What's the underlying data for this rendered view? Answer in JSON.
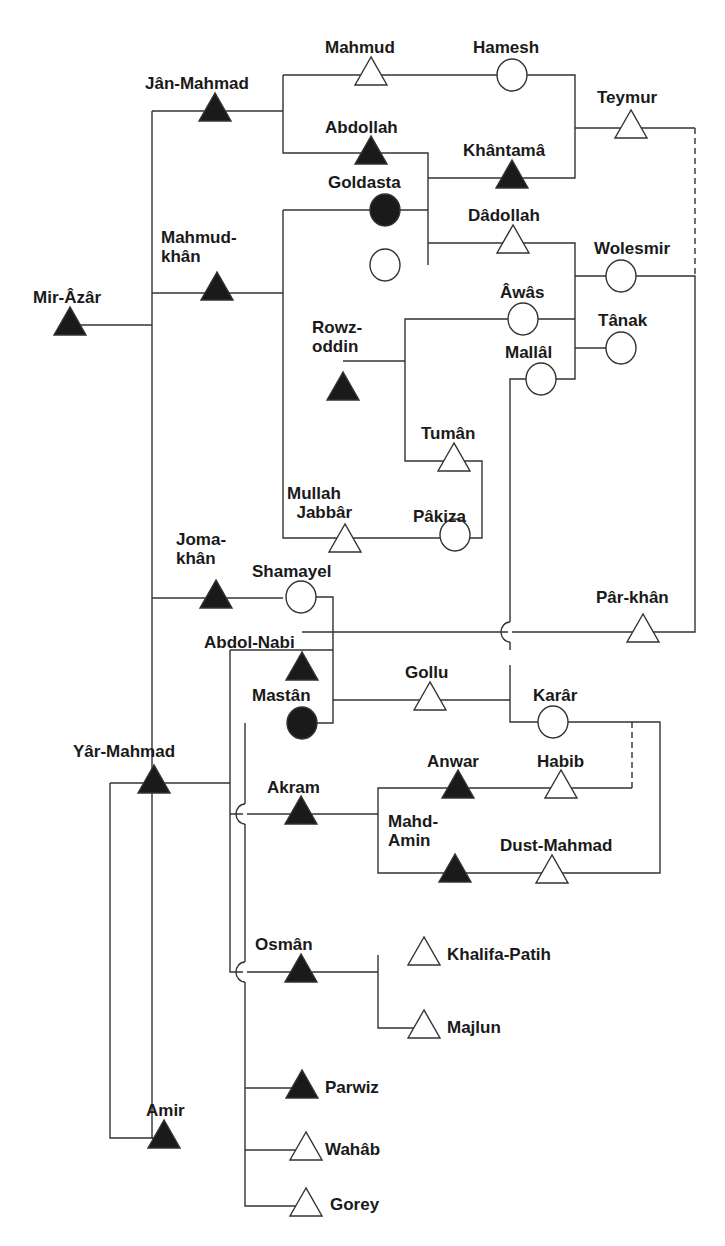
{
  "diagram": {
    "type": "kinship-genealogy",
    "legend_symbols": {
      "filled-triangle": "male (focal/linked)",
      "open-triangle": "male",
      "filled-circle": "female (focal/linked)",
      "open-circle": "female"
    },
    "colors": {
      "line": "#333333",
      "fill": "#1a1a1a",
      "background": "#ffffff"
    },
    "nodes": [
      {
        "id": "mir-azar",
        "label": "Mir-Âzâr",
        "shape": "triangle",
        "filled": true,
        "x": 70,
        "y": 325,
        "lx": 33,
        "ly": 288
      },
      {
        "id": "jan-mahmad",
        "label": "Jân-Mahmad",
        "shape": "triangle",
        "filled": true,
        "x": 215,
        "y": 111,
        "lx": 145,
        "ly": 74
      },
      {
        "id": "mahmud",
        "label": "Mahmud",
        "shape": "triangle",
        "filled": false,
        "x": 371,
        "y": 75,
        "lx": 325,
        "ly": 38
      },
      {
        "id": "hamesh",
        "label": "Hamesh",
        "shape": "circle",
        "filled": false,
        "x": 512,
        "y": 75,
        "lx": 473,
        "ly": 38
      },
      {
        "id": "teymur",
        "label": "Teymur",
        "shape": "triangle",
        "filled": false,
        "x": 631,
        "y": 128,
        "lx": 597,
        "ly": 88
      },
      {
        "id": "abdollah",
        "label": "Abdollah",
        "shape": "triangle",
        "filled": true,
        "x": 371,
        "y": 154,
        "lx": 325,
        "ly": 118
      },
      {
        "id": "khantama",
        "label": "Khântamâ",
        "shape": "triangle",
        "filled": true,
        "x": 512,
        "y": 178,
        "lx": 463,
        "ly": 141
      },
      {
        "id": "goldasta",
        "label": "Goldasta",
        "shape": "circle",
        "filled": true,
        "x": 385,
        "y": 210,
        "lx": 328,
        "ly": 173
      },
      {
        "id": "mahmud-khan",
        "label": "Mahmud-\nkhân",
        "shape": "triangle",
        "filled": true,
        "x": 217,
        "y": 290,
        "lx": 161,
        "ly": 228
      },
      {
        "id": "unnamed-female",
        "label": "",
        "shape": "circle",
        "filled": false,
        "x": 385,
        "y": 265,
        "lx": 0,
        "ly": 0
      },
      {
        "id": "dadollah",
        "label": "Dâdollah",
        "shape": "triangle",
        "filled": false,
        "x": 513,
        "y": 243,
        "lx": 468,
        "ly": 206
      },
      {
        "id": "wolesmir",
        "label": "Wolesmir",
        "shape": "circle",
        "filled": false,
        "x": 621,
        "y": 276,
        "lx": 594,
        "ly": 239
      },
      {
        "id": "awas",
        "label": "Âwâs",
        "shape": "circle",
        "filled": false,
        "x": 523,
        "y": 319,
        "lx": 500,
        "ly": 283
      },
      {
        "id": "tanak",
        "label": "Tânak",
        "shape": "circle",
        "filled": false,
        "x": 621,
        "y": 348,
        "lx": 598,
        "ly": 311
      },
      {
        "id": "rowz-oddin",
        "label": "Rowz-\noddin",
        "shape": "triangle",
        "filled": true,
        "x": 343,
        "y": 390,
        "lx": 312,
        "ly": 318
      },
      {
        "id": "mallal",
        "label": "Mallâl",
        "shape": "circle",
        "filled": false,
        "x": 541,
        "y": 379,
        "lx": 505,
        "ly": 343
      },
      {
        "id": "tuman",
        "label": "Tumân",
        "shape": "triangle",
        "filled": false,
        "x": 454,
        "y": 461,
        "lx": 421,
        "ly": 424
      },
      {
        "id": "mullah-jabbar",
        "label": "Mullah\n  Jabbâr",
        "shape": "triangle",
        "filled": false,
        "x": 345,
        "y": 542,
        "lx": 287,
        "ly": 484
      },
      {
        "id": "pakiza",
        "label": "Pâkiza",
        "shape": "circle",
        "filled": false,
        "x": 455,
        "y": 535,
        "lx": 413,
        "ly": 507
      },
      {
        "id": "joma-khan",
        "label": "Joma-\nkhân",
        "shape": "triangle",
        "filled": true,
        "x": 216,
        "y": 598,
        "lx": 176,
        "ly": 530
      },
      {
        "id": "shamayel",
        "label": "Shamayel",
        "shape": "circle",
        "filled": false,
        "x": 301,
        "y": 597,
        "lx": 252,
        "ly": 562
      },
      {
        "id": "par-khan",
        "label": "Pâr-khân",
        "shape": "triangle",
        "filled": false,
        "x": 643,
        "y": 632,
        "lx": 596,
        "ly": 588
      },
      {
        "id": "abdol-nabi",
        "label": "Abdol-Nabi",
        "shape": "triangle",
        "filled": true,
        "x": 302,
        "y": 670,
        "lx": 204,
        "ly": 633
      },
      {
        "id": "gollu",
        "label": "Gollu",
        "shape": "triangle",
        "filled": false,
        "x": 430,
        "y": 700,
        "lx": 405,
        "ly": 663
      },
      {
        "id": "mastan",
        "label": "Mastân",
        "shape": "circle",
        "filled": true,
        "x": 302,
        "y": 723,
        "lx": 252,
        "ly": 686
      },
      {
        "id": "karar",
        "label": "Karâr",
        "shape": "circle",
        "filled": false,
        "x": 553,
        "y": 722,
        "lx": 533,
        "ly": 686
      },
      {
        "id": "yar-mahmad",
        "label": "Yâr-Mahmad",
        "shape": "triangle",
        "filled": true,
        "x": 154,
        "y": 783,
        "lx": 73,
        "ly": 742
      },
      {
        "id": "anwar",
        "label": "Anwar",
        "shape": "triangle",
        "filled": true,
        "x": 458,
        "y": 788,
        "lx": 427,
        "ly": 752
      },
      {
        "id": "habib",
        "label": "Habib",
        "shape": "triangle",
        "filled": false,
        "x": 561,
        "y": 788,
        "lx": 537,
        "ly": 752
      },
      {
        "id": "akram",
        "label": "Akram",
        "shape": "triangle",
        "filled": true,
        "x": 301,
        "y": 814,
        "lx": 267,
        "ly": 778
      },
      {
        "id": "mahd-amin",
        "label": "Mahd-\nAmin",
        "shape": "triangle",
        "filled": true,
        "x": 455,
        "y": 872,
        "lx": 388,
        "ly": 812
      },
      {
        "id": "dust-mahmad",
        "label": "Dust-Mahmad",
        "shape": "triangle",
        "filled": false,
        "x": 552,
        "y": 873,
        "lx": 500,
        "ly": 836
      },
      {
        "id": "osman",
        "label": "Osmân",
        "shape": "triangle",
        "filled": true,
        "x": 301,
        "y": 972,
        "lx": 255,
        "ly": 935
      },
      {
        "id": "khalifa-patih",
        "label": "Khalifa-Patih",
        "shape": "triangle",
        "filled": false,
        "x": 424,
        "y": 955,
        "lx": 447,
        "ly": 945
      },
      {
        "id": "majlun",
        "label": "Majlun",
        "shape": "triangle",
        "filled": false,
        "x": 424,
        "y": 1028,
        "lx": 447,
        "ly": 1018
      },
      {
        "id": "parwiz",
        "label": "Parwiz",
        "shape": "triangle",
        "filled": true,
        "x": 302,
        "y": 1088,
        "lx": 325,
        "ly": 1078
      },
      {
        "id": "amir",
        "label": "Amir",
        "shape": "triangle",
        "filled": true,
        "x": 164,
        "y": 1138,
        "lx": 146,
        "ly": 1101
      },
      {
        "id": "wahab",
        "label": "Wahâb",
        "shape": "triangle",
        "filled": false,
        "x": 306,
        "y": 1150,
        "lx": 325,
        "ly": 1140
      },
      {
        "id": "gorey",
        "label": "Gorey",
        "shape": "triangle",
        "filled": false,
        "x": 306,
        "y": 1206,
        "lx": 330,
        "ly": 1195
      }
    ],
    "edges": [
      {
        "points": "80,325 152,325"
      },
      {
        "points": "152,111 152,1138 164,1138"
      },
      {
        "points": "152,111 283,111"
      },
      {
        "points": "152,293 283,293"
      },
      {
        "points": "152,598 283,598"
      },
      {
        "points": "283,75 283,153 428,153 428,265"
      },
      {
        "points": "283,75 575,75 575,178 428,178"
      },
      {
        "points": "575,128 695,128"
      },
      {
        "points": "283,210 428,210"
      },
      {
        "points": "283,210 283,538 470,538 482,538 482,461 405,461 405,319 575,319"
      },
      {
        "points": "405,361 343,361"
      },
      {
        "points": "428,243 575,243 575,379 510,379 510,650"
      },
      {
        "points": "575,276 695,276 695,632 302,632"
      },
      {
        "points": "575,348 621,348"
      },
      {
        "points": "302,597 333,597 333,723 302,723"
      },
      {
        "points": "333,700 510,700"
      },
      {
        "points": "510,665 510,722 660,722 660,873 378,873 378,788 632,788"
      },
      {
        "points": "230,650 333,650"
      },
      {
        "points": "110,783 230,783"
      },
      {
        "points": "230,650 230,972 378,972"
      },
      {
        "points": "230,814 378,814"
      },
      {
        "points": "378,955 378,1028 424,1028"
      },
      {
        "points": "245,723 245,1206 306,1206"
      },
      {
        "points": "245,1088 302,1088"
      },
      {
        "points": "245,1150 306,1150"
      },
      {
        "points": "110,783 110,1138 164,1138"
      }
    ],
    "dashed_edges": [
      {
        "points": "695,128 695,276"
      },
      {
        "points": "632,722 632,788"
      }
    ],
    "bridges": [
      {
        "x": 510,
        "y": 632
      },
      {
        "x": 245,
        "y": 814
      },
      {
        "x": 245,
        "y": 972
      }
    ]
  }
}
